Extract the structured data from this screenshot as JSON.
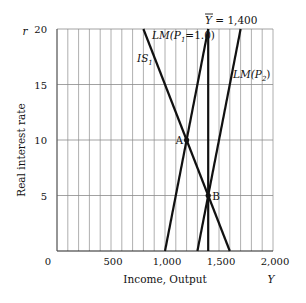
{
  "chart_data": {
    "type": "line",
    "title": "",
    "xlabel": "Income, Output",
    "xvar": "Y",
    "ylabel": "Real interest rate",
    "yvar": "r",
    "xlim": [
      0,
      2000
    ],
    "ylim": [
      0,
      20
    ],
    "grid": true,
    "x_ticks": [
      "0",
      "500",
      "1,000",
      "1,500",
      "2,000"
    ],
    "y_ticks": [
      "20",
      "15",
      "10",
      "5"
    ],
    "series": [
      {
        "name": "IS1",
        "label": "IS",
        "sub": "1",
        "points": [
          [
            800,
            20
          ],
          [
            1600,
            0
          ]
        ]
      },
      {
        "name": "LM(P1=1.0)",
        "label": "LM(P",
        "sub": "1",
        "tail": "=1.0)",
        "points": [
          [
            1000,
            0
          ],
          [
            1400,
            20
          ]
        ]
      },
      {
        "name": "LM(P2)",
        "label": "LM(P",
        "sub": "2",
        "tail": ")",
        "points": [
          [
            1300,
            0
          ],
          [
            1700,
            20
          ]
        ]
      },
      {
        "name": "Ybar = 1,400",
        "label": "Y",
        "tail": " = 1,400",
        "points": [
          [
            1400,
            0
          ],
          [
            1400,
            20
          ]
        ]
      }
    ],
    "annotations": [
      {
        "label": "A",
        "x": 1200,
        "y": 10
      },
      {
        "label": "B",
        "x": 1400,
        "y": 5
      }
    ]
  }
}
